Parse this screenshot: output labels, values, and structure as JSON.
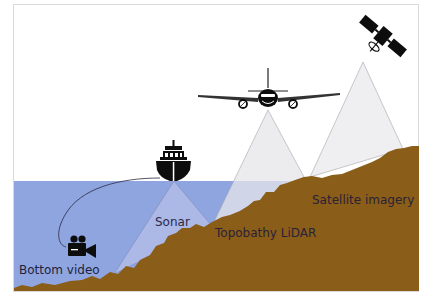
{
  "diagram": {
    "labels": {
      "satellite": "Satellite imagery",
      "lidar": "Topobathy LiDAR",
      "sonar": "Sonar",
      "video": "Bottom video"
    },
    "icons": {
      "satellite": "satellite-icon",
      "airplane": "airplane-icon",
      "ship": "ship-icon",
      "camera": "video-camera-icon"
    },
    "colors": {
      "water": "#8fa5df",
      "terrain": "#8a5d18",
      "beam": "#e6e6ea",
      "beam_stroke": "#9a9aa2",
      "frame": "#d8d8d8",
      "label_dark": "#2b2a46",
      "icon": "#0d0d0d"
    }
  }
}
